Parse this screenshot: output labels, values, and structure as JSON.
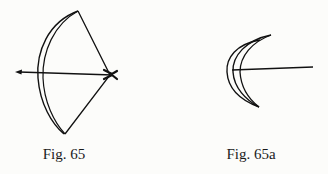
{
  "figures": [
    {
      "id": "fig65",
      "caption": "Fig. 65",
      "subject": "bow drawn with arrow nocked on string"
    },
    {
      "id": "fig65a",
      "caption": "Fig. 65a",
      "subject": "bow limb cross-section (crescent) with arrow"
    }
  ],
  "colors": {
    "ink": "#111111",
    "paper": "#fcfcfa"
  }
}
